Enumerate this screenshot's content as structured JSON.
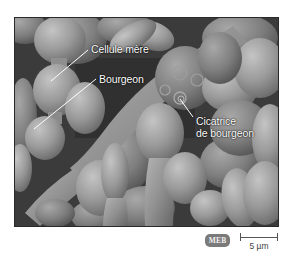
{
  "figure": {
    "type": "scanning electron micrograph",
    "labels": {
      "mother_cell": "Cellule mère",
      "bud": "Bourgeon",
      "bud_scar_line1": "Cicatrice",
      "bud_scar_line2": "de bourgeon"
    },
    "badge": "MEB",
    "scale": {
      "value": "5 µm"
    },
    "colors": {
      "background": "#ffffff",
      "micrograph_dark": "#3a3a3a",
      "cell_mid": "#8c8c8c",
      "cell_light": "#b8b8b8",
      "label_text": "#ffffff",
      "badge_fill": "#7a7a7a",
      "badge_text": "#f2f2f2",
      "scale_color": "#555555"
    }
  }
}
